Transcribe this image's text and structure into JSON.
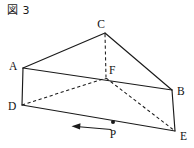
{
  "figure": {
    "caption": "図 3",
    "shape_name": "triangular-prism",
    "stroke_color": "#1a1a1a",
    "background_color": "#ffffff"
  },
  "labels": {
    "A": "A",
    "B": "B",
    "C": "C",
    "D": "D",
    "E": "E",
    "F": "F",
    "P": "P"
  },
  "geometry": {
    "points": {
      "A": {
        "x": 23,
        "y": 68
      },
      "B": {
        "x": 172,
        "y": 90
      },
      "C": {
        "x": 105,
        "y": 33
      },
      "D": {
        "x": 22,
        "y": 105
      },
      "E": {
        "x": 175,
        "y": 131
      },
      "F": {
        "x": 106,
        "y": 78
      },
      "P": {
        "x": 113,
        "y": 122
      }
    },
    "solid_edges": [
      "A-C",
      "C-B",
      "A-B",
      "A-D",
      "B-E",
      "D-E"
    ],
    "dashed_edges": [
      "C-F",
      "D-F",
      "F-E"
    ],
    "label_offsets": {
      "A": {
        "x": 9,
        "y": 70
      },
      "B": {
        "x": 177,
        "y": 95
      },
      "C": {
        "x": 101,
        "y": 28
      },
      "D": {
        "x": 8,
        "y": 110
      },
      "E": {
        "x": 180,
        "y": 138
      },
      "F": {
        "x": 109,
        "y": 74
      },
      "P": {
        "x": 109,
        "y": 137
      }
    }
  },
  "annotation": {
    "arrow": {
      "name": "motion-arrow",
      "direction": "left",
      "from_x": 110,
      "to_x": 73,
      "y": 128
    },
    "point_marker": {
      "name": "point-p-marker",
      "x": 113,
      "y": 122,
      "radius": 2
    }
  }
}
